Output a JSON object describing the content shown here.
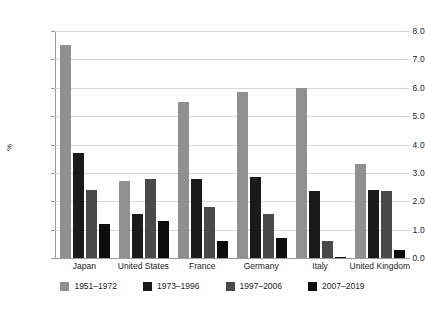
{
  "chart_data": {
    "type": "bar",
    "title": "",
    "xlabel": "",
    "ylabel": "%",
    "ylim": [
      0,
      8
    ],
    "ytick_labels": [
      "0.0",
      "1.0",
      "2.0",
      "3.0",
      "4.0",
      "5.0",
      "6.0",
      "7.0",
      "8.0"
    ],
    "ytick_values": [
      0,
      1,
      2,
      3,
      4,
      5,
      6,
      7,
      8
    ],
    "grid": true,
    "legend_position": "bottom",
    "categories": [
      "Japan",
      "United States",
      "France",
      "Germany",
      "Italy",
      "United Kingdom"
    ],
    "series": [
      {
        "name": "1951–1972",
        "color": "#909090",
        "values": [
          7.5,
          2.7,
          5.5,
          5.85,
          6.0,
          3.3
        ]
      },
      {
        "name": "1973–1996",
        "color": "#1a1a1a",
        "values": [
          3.7,
          1.55,
          2.8,
          2.85,
          2.35,
          2.4
        ]
      },
      {
        "name": "1997–2006",
        "color": "#4a4a4a",
        "values": [
          2.4,
          2.8,
          1.8,
          1.55,
          0.6,
          2.35
        ]
      },
      {
        "name": "2007–2019",
        "color": "#0d0d0d",
        "values": [
          1.2,
          1.3,
          0.6,
          0.7,
          0.05,
          0.3
        ]
      }
    ]
  }
}
